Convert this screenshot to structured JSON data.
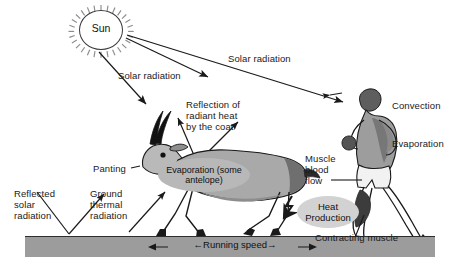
{
  "figure": {
    "background_color": "#ffffff",
    "ground_color": "#9c9c9c",
    "ink_color": "#1a1a1a"
  },
  "sun": {
    "label": "Sun",
    "icon": "sun-icon"
  },
  "labels": {
    "solar_radiation_left": "Solar radiation",
    "solar_radiation_right": "Solar radiation",
    "reflected_solar_radiation": "Reflected\nsolar\nradiation",
    "ground_thermal_radiation": "Ground\nthermal\nradiation",
    "reflection_radiant_heat": "Reflection of\nradiant heat\nby the coat",
    "panting": "Panting",
    "evaporation_antelope": "Evaporation\n(some antelope)",
    "convection": "Convection",
    "evaporation_human": "Evaporation",
    "muscle_blood_flow": "Muscle\nblood\nflow",
    "heat_production": "Heat\nProduction",
    "contracting_muscle": "Contracting muscle",
    "running_speed": "←Running speed→"
  },
  "animals": {
    "antelope": "antelope-figure",
    "human_runner": "human-runner-figure"
  },
  "arrows": [
    {
      "name": "sun-to-antelope",
      "from": "sun",
      "to": "antelope"
    },
    {
      "name": "sun-to-coat",
      "from": "sun",
      "to": "antelope-coat"
    },
    {
      "name": "sun-to-human",
      "from": "sun",
      "to": "human-runner"
    },
    {
      "name": "reflected-solar-radiation-arrow",
      "from": "ground",
      "to": "sky"
    },
    {
      "name": "ground-thermal-radiation-arrow",
      "from": "ground",
      "to": "antelope"
    },
    {
      "name": "coat-reflection-arrow-left",
      "from": "antelope-coat",
      "to": "sky"
    },
    {
      "name": "coat-reflection-arrow-right",
      "from": "antelope-coat",
      "to": "sky"
    },
    {
      "name": "heat-production-arrow",
      "from": "heat-production",
      "to": "ground"
    },
    {
      "name": "running-speed-arrow",
      "from": "left",
      "to": "right"
    }
  ]
}
